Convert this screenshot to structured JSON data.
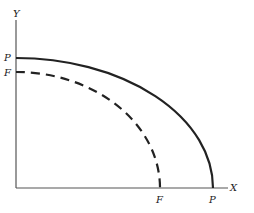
{
  "diagram": {
    "type": "production-possibility-frontier",
    "axes": {
      "x_label": "X",
      "y_label": "Y",
      "origin": [
        16,
        188
      ],
      "x_end": 228,
      "y_end": 20
    },
    "curves": [
      {
        "name": "P",
        "style": "solid",
        "y_intercept_label": "P",
        "x_intercept_label": "P",
        "x_intercept_px": 213,
        "y_intercept_px": 58
      },
      {
        "name": "F",
        "style": "dashed",
        "y_intercept_label": "F",
        "x_intercept_label": "F",
        "x_intercept_px": 160,
        "y_intercept_px": 72
      }
    ],
    "colors": {
      "line": "#222222",
      "axis": "#555555",
      "background": "#ffffff"
    }
  }
}
